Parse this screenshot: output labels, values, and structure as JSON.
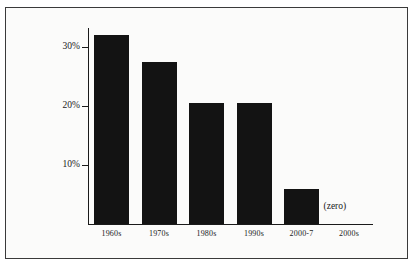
{
  "figure": {
    "clipped_caption_fragment": "",
    "zero_annotation": "(zero)",
    "frame_color": "#3a3a3a",
    "background_color": "#fbfbfa",
    "bar_color": "#131313",
    "axis_color": "#1a1a1a"
  },
  "chart_data": {
    "type": "bar",
    "title": "",
    "subtitle": "",
    "xlabel": "",
    "ylabel": "",
    "categories": [
      "1960s",
      "1970s",
      "1980s",
      "1990s",
      "2000-7",
      "2000s"
    ],
    "values": [
      32,
      27.5,
      20.5,
      20.5,
      6,
      0
    ],
    "value_labels": [
      "",
      "",
      "",
      "",
      "",
      "(zero)"
    ],
    "ylim": [
      0,
      34
    ],
    "ytick_values": [
      10,
      20,
      30
    ],
    "ytick_labels": [
      "10%",
      "20%",
      "30%"
    ],
    "grid": false,
    "legend": null,
    "annotations": [
      {
        "text": "(zero)",
        "category": "2000s",
        "note": "marks the zero-height bar for the 2000s"
      }
    ]
  },
  "axes": {
    "y_ticks": [
      {
        "label": "30%",
        "value": 30
      },
      {
        "label": "20%",
        "value": 20
      },
      {
        "label": "10%",
        "value": 10
      }
    ],
    "x_categories": [
      {
        "label": "1960s"
      },
      {
        "label": "1970s"
      },
      {
        "label": "1980s"
      },
      {
        "label": "1990s"
      },
      {
        "label": "2000-7"
      },
      {
        "label": "2000s"
      }
    ]
  }
}
